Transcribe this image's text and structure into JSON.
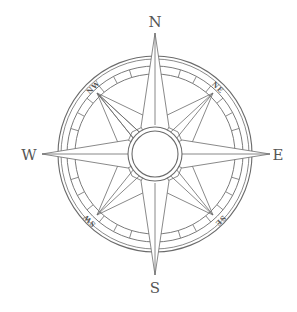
{
  "image": {
    "subject": "compass rose",
    "line_color": "#6b6b6b",
    "background": "#ffffff"
  },
  "compass": {
    "cardinals": {
      "north": "N",
      "east": "E",
      "south": "S",
      "west": "W"
    },
    "intercardinals": {
      "northwest": "NW",
      "northeast": "NE",
      "southwest": "SW",
      "southeast": "SE"
    }
  }
}
